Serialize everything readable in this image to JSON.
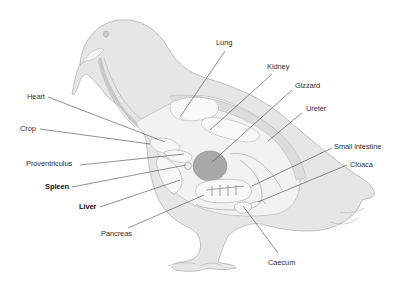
{
  "diagram": {
    "colors": {
      "body_fill": "#e6e6e6",
      "body_stroke": "#b3b3b3",
      "inner_fill": "#f4f4f4",
      "organ_light": "#f7f7f7",
      "gizzard_fill": "#a9a9a9",
      "leader_line": "#444444",
      "text": "#333333"
    },
    "labels": {
      "lung": "Lung",
      "kidney": "Kidney",
      "gizzard": "Gizzard",
      "ureter": "Ureter",
      "heart": "Heart",
      "crop": "Crop",
      "small_intestine": "Small intestine",
      "cloaca": "Cloaca",
      "proventriculus": "Proventriculus",
      "spleen": "Spleen",
      "liver": "Liver",
      "pancreas": "Pancreas",
      "caecum": "Caecum"
    },
    "emphasized_labels": [
      "Spleen",
      "Liver"
    ]
  }
}
